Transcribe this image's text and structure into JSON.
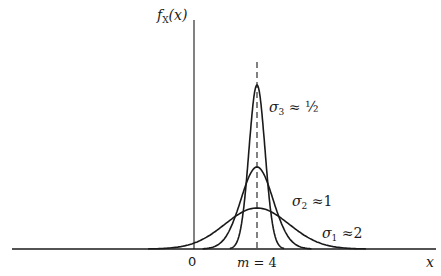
{
  "diagram": {
    "type": "normal-density-family",
    "y_axis_label": {
      "f": "f",
      "sub": "X",
      "arg": "(x)"
    },
    "x_axis_label": "x",
    "ticks": {
      "zero": "0",
      "mean_var": "m",
      "mean_eq": " = 4"
    },
    "mean": 4,
    "curves": [
      {
        "name": "sigma-3",
        "sym": "σ",
        "sub": "3",
        "approx": " ≈ ½",
        "sigma": 0.5
      },
      {
        "name": "sigma-2",
        "sym": "σ",
        "sub": "2",
        "approx": " ≈1",
        "sigma": 1
      },
      {
        "name": "sigma-1",
        "sym": "σ",
        "sub": "1",
        "approx": " ≈2",
        "sigma": 2
      }
    ],
    "colors": {
      "ink": "#1a1a1a",
      "background": "#ffffff"
    }
  }
}
